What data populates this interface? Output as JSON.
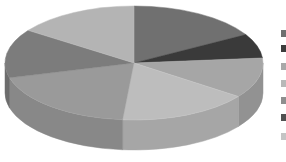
{
  "chart_data": {
    "type": "pie",
    "style": "3d",
    "title": "",
    "start_angle_deg": 0,
    "direction": "clockwise",
    "slices": [
      {
        "label": "",
        "value": 16.7,
        "color": "#707070"
      },
      {
        "label": "",
        "value": 6.9,
        "color": "#3a3a3a"
      },
      {
        "label": "",
        "value": 11.4,
        "color": "#a6a6a6"
      },
      {
        "label": "",
        "value": 16.4,
        "color": "#bdbdbd"
      },
      {
        "label": "",
        "value": 19.4,
        "color": "#9a9a9a"
      },
      {
        "label": "",
        "value": 13.9,
        "color": "#7c7c7c"
      },
      {
        "label": "",
        "value": 15.3,
        "color": "#b4b4b4"
      }
    ],
    "legend": {
      "position": "right",
      "entries": [
        {
          "label": "",
          "color": "#6e6e6e"
        },
        {
          "label": "",
          "color": "#3c3c3c"
        },
        {
          "label": "",
          "color": "#a8a8a8"
        },
        {
          "label": "",
          "color": "#b8b8b8"
        },
        {
          "label": "",
          "color": "#8e8e8e"
        },
        {
          "label": "",
          "color": "#505050"
        },
        {
          "label": "",
          "color": "#c4c4c4"
        }
      ]
    }
  }
}
